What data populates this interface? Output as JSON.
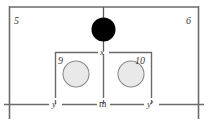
{
  "figure": {
    "colors": {
      "line": "#6b6b6b",
      "line_dark": "#555555",
      "solid_fill": "#000000",
      "circle_fill": "#e9e9e9",
      "circle_stroke": "#8a8a8a",
      "text": "#3a3a3a",
      "background": "#ffffff"
    },
    "reference_numbers": {
      "outer_left": "5",
      "outer_right": "6",
      "inner_left": "9",
      "inner_right": "10"
    },
    "dimension_labels": {
      "top_center": "x",
      "bottom_left": "y",
      "bottom_center": "m",
      "bottom_right": "y′"
    },
    "elements": {
      "outer_enclosure": "outer-rectangle",
      "solid_circle": "filled-black-circle",
      "left_cell": "left-inner-box",
      "right_cell": "right-inner-box",
      "left_circle": "left-gray-circle",
      "right_circle": "right-gray-circle",
      "center_axis": "vertical-centerline",
      "upper_dimension_line": "x-dimension-line",
      "lower_dimension_line": "y-m-y-prime-dimension-line"
    }
  }
}
